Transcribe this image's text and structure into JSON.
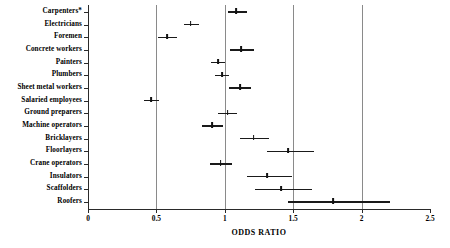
{
  "chart_data": {
    "type": "scatter",
    "plot_style": "forest-plot",
    "title": "",
    "xlabel": "ODDS RATIO",
    "ylabel": "",
    "xlim": [
      0,
      2.5
    ],
    "xticks": [
      0,
      0.5,
      1,
      1.5,
      2,
      2.5
    ],
    "xticklabels": [
      "0",
      "0.5",
      "1",
      "1.5",
      "2",
      "2.5"
    ],
    "gridlines_x": [
      0.5,
      1,
      1.5,
      2
    ],
    "grid": true,
    "legend": "none",
    "reference_line": 1,
    "categories": [
      "Carpenters*",
      "Electricians",
      "Foremen",
      "Concrete workers",
      "Painters",
      "Plumbers",
      "Sheet metal workers",
      "Salaried employees",
      "Ground preparers",
      "Machine operators",
      "Bricklayers",
      "Floorlayers",
      "Crane operators",
      "Insulators",
      "Scaffolders",
      "Roofers"
    ],
    "values": [
      1.08,
      0.75,
      0.58,
      1.12,
      0.95,
      0.98,
      1.11,
      0.46,
      1.02,
      0.91,
      1.21,
      1.46,
      0.97,
      1.31,
      1.41,
      1.79
    ],
    "ci_low": [
      1.02,
      0.7,
      0.51,
      1.04,
      0.9,
      0.93,
      1.03,
      0.41,
      0.95,
      0.83,
      1.11,
      1.31,
      0.89,
      1.16,
      1.22,
      1.46
    ],
    "ci_high": [
      1.16,
      0.81,
      0.65,
      1.21,
      1.0,
      1.03,
      1.19,
      0.52,
      1.09,
      0.99,
      1.32,
      1.65,
      1.05,
      1.49,
      1.64,
      2.21
    ],
    "series_name": "Odds ratio with 95% confidence interval",
    "footnote_marker": "*"
  },
  "axis": {
    "x_title": "ODDS RATIO"
  }
}
